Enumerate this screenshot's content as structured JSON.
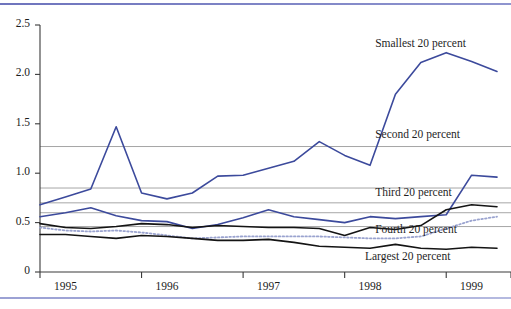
{
  "figure": {
    "top_rule_color": "#6e74bd",
    "bottom_rule_color": "#9ba1d4",
    "background": "#ffffff"
  },
  "chart_data": {
    "type": "line",
    "title": "",
    "subtitle": "",
    "xlabel": "",
    "ylabel": "",
    "xlim": [
      1994.75,
      1999.25
    ],
    "ylim": [
      0,
      2.5
    ],
    "yticks": [
      0,
      0.5,
      1.0,
      1.5,
      2.0,
      2.5
    ],
    "ytick_labels": [
      "0",
      "0.5",
      "1.0",
      "1.5",
      "2.0",
      "2.5"
    ],
    "xticks": [
      1995,
      1996,
      1997,
      1998,
      1999
    ],
    "xtick_labels": [
      "1995",
      "1996",
      "1997",
      "1998",
      "1999"
    ],
    "grid": true,
    "gridlines_y": [
      1.27,
      0.85,
      0.7,
      0.6,
      0.46
    ],
    "legend_position": "inline-right",
    "x": [
      1994.75,
      1995.0,
      1995.25,
      1995.5,
      1995.75,
      1996.0,
      1996.25,
      1996.5,
      1996.75,
      1997.0,
      1997.25,
      1997.5,
      1997.75,
      1998.0,
      1998.25,
      1998.5,
      1998.75,
      1999.0,
      1999.25
    ],
    "series": [
      {
        "name": "Smallest 20 percent",
        "color": "#3c4a9c",
        "style": "solid",
        "width": 1.6,
        "label_value": 1.27,
        "values": [
          0.68,
          0.76,
          0.84,
          1.47,
          0.8,
          0.74,
          0.8,
          0.97,
          0.98,
          1.05,
          1.12,
          1.32,
          1.18,
          1.08,
          1.8,
          2.12,
          2.22,
          2.13,
          2.03
        ]
      },
      {
        "name": "Second 20 percent",
        "color": "#3c4a9c",
        "style": "solid",
        "width": 1.6,
        "label_value": 0.85,
        "values": [
          0.56,
          0.6,
          0.65,
          0.57,
          0.52,
          0.51,
          0.44,
          0.48,
          0.55,
          0.63,
          0.56,
          0.53,
          0.5,
          0.56,
          0.54,
          0.56,
          0.58,
          0.98,
          0.96
        ]
      },
      {
        "name": "Third 20 percent",
        "color": "#141414",
        "style": "solid",
        "width": 1.6,
        "label_value": 0.7,
        "values": [
          0.49,
          0.45,
          0.44,
          0.46,
          0.49,
          0.48,
          0.45,
          0.47,
          0.46,
          0.45,
          0.45,
          0.44,
          0.37,
          0.45,
          0.43,
          0.47,
          0.63,
          0.68,
          0.66
        ]
      },
      {
        "name": "Fourth 20 percent",
        "color": "#9aa3cf",
        "style": "dotted",
        "width": 1.8,
        "label_value": 0.46,
        "values": [
          0.45,
          0.42,
          0.41,
          0.42,
          0.4,
          0.37,
          0.34,
          0.35,
          0.36,
          0.36,
          0.36,
          0.36,
          0.35,
          0.34,
          0.34,
          0.36,
          0.44,
          0.52,
          0.56
        ]
      },
      {
        "name": "Largest 20 percent",
        "color": "#141414",
        "style": "solid",
        "width": 1.6,
        "label_value": 0.22,
        "values": [
          0.38,
          0.38,
          0.36,
          0.34,
          0.37,
          0.36,
          0.34,
          0.32,
          0.32,
          0.33,
          0.3,
          0.26,
          0.25,
          0.24,
          0.28,
          0.24,
          0.23,
          0.25,
          0.24
        ]
      }
    ],
    "annotations": [
      {
        "text": "Smallest 20 percent",
        "x": 1998.05,
        "y": 2.3
      },
      {
        "text": "Second 20 percent",
        "x": 1998.05,
        "y": 1.38
      },
      {
        "text": "Third 20 percent",
        "x": 1998.05,
        "y": 0.79
      },
      {
        "text": "Fourth 20 percent",
        "x": 1998.05,
        "y": 0.42
      },
      {
        "text": "Largest 20 percent",
        "x": 1997.95,
        "y": 0.14
      }
    ]
  }
}
